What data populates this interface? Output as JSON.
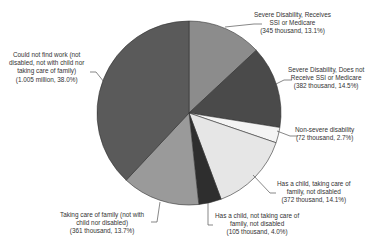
{
  "chart_data": {
    "type": "pie",
    "title": "",
    "unit": "thousand",
    "slices": [
      {
        "label": "Severe Disability, Receives SSI or Medicare",
        "value_text": "345 thousand",
        "value": 345,
        "percent": 13.1,
        "color": "#8c8c8c"
      },
      {
        "label": "Severe Disability, Does not Receive SSI or Medicare",
        "value_text": "382 thousand",
        "value": 382,
        "percent": 14.5,
        "color": "#4a4a4a"
      },
      {
        "label": "Non-severe disability",
        "value_text": "72 thousand",
        "value": 72,
        "percent": 2.7,
        "color": "#f4f4f4"
      },
      {
        "label": "Has a child, taking care of family, not disabled",
        "value_text": "372 thousand",
        "value": 372,
        "percent": 14.1,
        "color": "#e6e6e6"
      },
      {
        "label": "Has a child, not taking care of family, not disabled",
        "value_text": "105 thousand",
        "value": 105,
        "percent": 4.0,
        "color": "#2e2e2e"
      },
      {
        "label": "Taking care of family (not with child nor disabled)",
        "value_text": "361 thousand",
        "value": 361,
        "percent": 13.7,
        "color": "#9a9a9a"
      },
      {
        "label": "Could not find work (not disabled, not with child nor taking care of family)",
        "value_text": "1.005 million",
        "value": 1005,
        "percent": 38.0,
        "color": "#5a5a5a"
      }
    ]
  },
  "labels": {
    "s0": [
      "Severe Disability, Receives",
      "SSI or Medicare",
      "(345 thousand, 13.1%)"
    ],
    "s1": [
      "Severe Disability, Does not",
      "Receive SSI or Medicare",
      "(382 thousand, 14.5%)"
    ],
    "s2": [
      "Non-severe disability",
      "(72 thousand, 2.7%)"
    ],
    "s3": [
      "Has a child, taking care of",
      "family, not disabled",
      "(372 thousand, 14.1%)"
    ],
    "s4": [
      "Has a child, not taking care of",
      "family, not disabled",
      "(105 thousand, 4.0%)"
    ],
    "s5": [
      "Taking care of family (not with",
      "child nor disabled)",
      "(361 thousand, 13.7%)"
    ],
    "s6": [
      "Could not find work (not",
      "disabled, not with child nor",
      "taking care of family)",
      "(1.005 million, 38.0%)"
    ]
  }
}
